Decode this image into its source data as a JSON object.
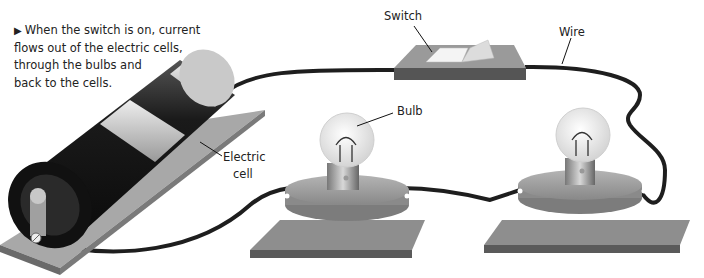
{
  "caption": {
    "marker": "▶",
    "lines": [
      "When the switch is on, current",
      "flows out of the electric cells,",
      "through the bulbs and",
      "back to the cells."
    ]
  },
  "labels": {
    "switch": "Switch",
    "wire": "Wire",
    "bulb": "Bulb",
    "electric_cell_line1": "Electric",
    "electric_cell_line2": "cell"
  },
  "components": [
    "electric-cell",
    "switch",
    "bulb-left",
    "bulb-right",
    "wire"
  ],
  "colors": {
    "cell_dark": "#1a1a1a",
    "cell_band": "#c8c8c8",
    "base": "#8c8c8c",
    "wire": "#1e1e1e",
    "text": "#222222"
  }
}
